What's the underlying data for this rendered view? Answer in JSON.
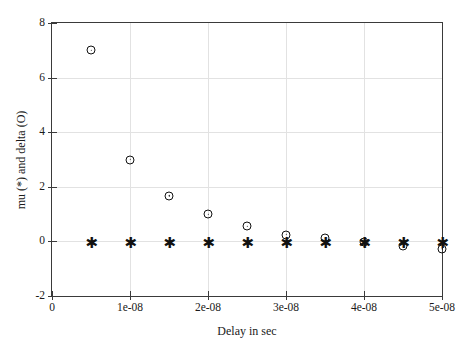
{
  "chart_data": {
    "type": "scatter",
    "title": "",
    "xlabel": "Delay in sec",
    "ylabel": "mu (*) and delta (O)",
    "xlim": [
      0,
      5e-08
    ],
    "ylim": [
      -2,
      8
    ],
    "grid": true,
    "legend": "none",
    "xticks": [
      "0",
      "1e-08",
      "2e-08",
      "3e-08",
      "4e-08",
      "5e-08"
    ],
    "xtick_values": [
      0,
      1e-08,
      2e-08,
      3e-08,
      4e-08,
      5e-08
    ],
    "yticks": [
      "-2",
      "0",
      "2",
      "4",
      "6",
      "8"
    ],
    "ytick_values": [
      -2,
      0,
      2,
      4,
      6,
      8
    ],
    "x": [
      5e-09,
      1e-08,
      1.5e-08,
      2e-08,
      2.5e-08,
      3e-08,
      3.5e-08,
      4e-08,
      4.5e-08,
      5e-08
    ],
    "series": [
      {
        "name": "delta (O)",
        "marker": "circle",
        "color": "#111111",
        "values": [
          7.0,
          3.0,
          1.67,
          1.0,
          0.55,
          0.25,
          0.12,
          -0.02,
          -0.18,
          -0.27
        ]
      },
      {
        "name": "mu (*)",
        "marker": "star",
        "color": "#111111",
        "values": [
          -0.05,
          -0.05,
          -0.05,
          -0.05,
          -0.05,
          -0.05,
          -0.05,
          -0.05,
          -0.05,
          -0.05
        ]
      }
    ]
  },
  "axes": {
    "frame_color": "#3a3a3a",
    "grid_color": "#e2e2e2",
    "background": "#ffffff"
  }
}
